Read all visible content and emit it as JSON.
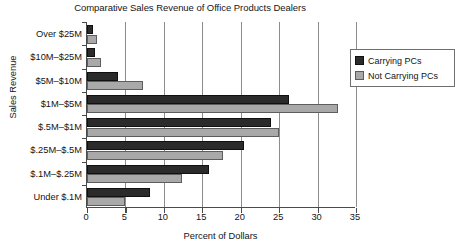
{
  "chart_data": {
    "type": "bar",
    "orientation": "horizontal",
    "title": "Comparative Sales Revenue of Office Products Dealers",
    "xlabel": "Percent of Dollars",
    "ylabel": "Sales Revenue",
    "xlim": [
      0,
      35
    ],
    "xticks": [
      "0",
      "5",
      "10",
      "15",
      "20",
      "25",
      "30",
      "35"
    ],
    "grid": "vertical",
    "legend_position": "top-right",
    "categories": [
      "Over $25M",
      "$10M–$25M",
      "$5M–$10M",
      "$1M–$5M",
      "$.5M–$1M",
      "$.25M–$.5M",
      "$.1M–$.25M",
      "Under $.1M"
    ],
    "series": [
      {
        "name": "Carrying PCs",
        "color": "#2b2b2b",
        "values": [
          0.8,
          1.0,
          4.0,
          26.3,
          24.0,
          20.4,
          15.9,
          8.2
        ]
      },
      {
        "name": "Not Carrying PCs",
        "color": "#a9a9a9",
        "values": [
          1.3,
          1.8,
          7.3,
          32.6,
          25.0,
          17.7,
          12.3,
          5.0
        ]
      }
    ]
  }
}
